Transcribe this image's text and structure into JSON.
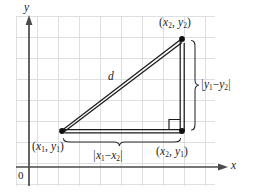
{
  "figure": {
    "kind": "distance-formula-diagram",
    "title": "",
    "background_color": "#ffffff",
    "grid": {
      "visible": true,
      "color": "#d9dde0",
      "cell_size_px": 21,
      "left": 16,
      "top": 16,
      "right": 215,
      "bottom": 186
    },
    "axes": {
      "x_label": "x",
      "y_label": "y",
      "origin_label": "0",
      "axis_color": "#4a4a4a",
      "x_axis_y": 167,
      "y_axis_x": 29
    },
    "triangle": {
      "stroke_color": "#1a1a1a",
      "vertices": [
        {
          "name": "lower-left",
          "label": "(x₁, y₁)",
          "x": 62,
          "y": 131
        },
        {
          "name": "upper-right",
          "label": "(x₂, y₂)",
          "x": 182,
          "y": 39
        },
        {
          "name": "lower-right",
          "label": "(x₂, y₁)",
          "x": 182,
          "y": 131
        }
      ],
      "right_angle_marker": true
    },
    "labels": {
      "point_1": {
        "open": "(",
        "x_var": "x",
        "x_sub": "1",
        "sep": ", ",
        "y_var": "y",
        "y_sub": "1",
        "close": ")"
      },
      "point_2": {
        "open": "(",
        "x_var": "x",
        "x_sub": "2",
        "sep": ", ",
        "y_var": "y",
        "y_sub": "2",
        "close": ")"
      },
      "point_3": {
        "open": "(",
        "x_var": "x",
        "x_sub": "2",
        "sep": ", ",
        "y_var": "y",
        "y_sub": "1",
        "close": ")"
      },
      "hypotenuse": "d",
      "vertical_leg": {
        "bar_open": "|",
        "a_var": "y",
        "a_sub": "1",
        "minus": "−",
        "b_var": "y",
        "b_sub": "2",
        "bar_close": "|"
      },
      "horizontal_leg": {
        "bar_open": "|",
        "a_var": "x",
        "a_sub": "1",
        "minus": "−",
        "b_var": "x",
        "b_sub": "2",
        "bar_close": "|"
      }
    },
    "braces": {
      "vertical": {
        "present": true,
        "orientation": "right"
      },
      "horizontal": {
        "present": true,
        "orientation": "bottom"
      }
    }
  }
}
